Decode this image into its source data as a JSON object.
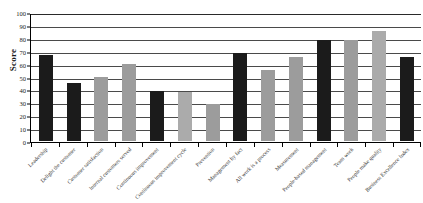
{
  "chart_data": {
    "type": "bar",
    "title": "",
    "subtitle": "",
    "xlabel": "",
    "ylabel": "Score",
    "ylim": [
      0,
      100
    ],
    "ytick_step": 10,
    "yticks": [
      "0",
      "10",
      "20",
      "30",
      "40",
      "50",
      "60",
      "70",
      "80",
      "90",
      "100"
    ],
    "grid": true,
    "legend": "none",
    "categories": [
      "Leadership",
      "Delight the customer",
      "Customer satisfaction",
      "Internal customers served",
      "Continuous improvement",
      "Continuous improvement cycle",
      "Prevention",
      "Management by fact",
      "All work is a process",
      "Measurement",
      "People-based management",
      "Team work",
      "People make quality",
      "Business Excellence Index"
    ],
    "values": [
      67,
      45,
      50,
      60,
      39,
      38,
      29,
      68,
      55,
      65,
      78,
      78,
      85,
      65
    ],
    "bar_colors": [
      "#1b1b1b",
      "#1b1b1b",
      "#9c9c9c",
      "#9c9c9c",
      "#1b1b1b",
      "#ababab",
      "#9c9c9c",
      "#1b1b1b",
      "#9c9c9c",
      "#9c9c9c",
      "#1b1b1b",
      "#9c9c9c",
      "#ababab",
      "#1b1b1b"
    ]
  },
  "colors": {
    "dark_series": "#1b1b1b",
    "light_series": "#9c9c9c",
    "background": "#ffffff",
    "axis": "#000000",
    "gridline": "#4a4a4a"
  }
}
